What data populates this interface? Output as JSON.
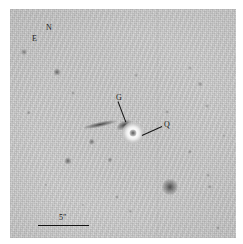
{
  "figure": {
    "type": "astronomical-finding-chart",
    "rendering": "negative-grayscale",
    "background_color": "#ffffff",
    "plate_color": "#d6d6d6",
    "ink_color": "#151515"
  },
  "compass": {
    "north_label": "N",
    "east_label": "E",
    "north_x": 36,
    "north_y": 15,
    "east_x": 22,
    "east_y": 26
  },
  "annotations": [
    {
      "label": "G",
      "meaning": "galaxy",
      "label_x": 106,
      "label_y": 85,
      "leader_from_x": 108,
      "leader_from_y": 92,
      "leader_to_x": 116,
      "leader_to_y": 113
    },
    {
      "label": "Q",
      "meaning": "quasar",
      "label_x": 154,
      "label_y": 112,
      "leader_from_x": 152,
      "leader_from_y": 117,
      "leader_to_x": 132,
      "leader_to_y": 126
    }
  ],
  "scalebar": {
    "label": "5″",
    "value": 5,
    "unit": "arcsec",
    "label_x": 49,
    "label_y": 205,
    "line_x1": 28,
    "line_x2": 79,
    "line_y": 216
  },
  "objects": {
    "quasar": {
      "x": 123,
      "y": 124,
      "size": 22,
      "core_size": 7
    },
    "galaxy_knot": {
      "x": 114,
      "y": 116,
      "w": 16,
      "h": 8,
      "angle": -28
    },
    "galaxy_streak": {
      "x": 90,
      "y": 115,
      "w": 34,
      "h": 5,
      "angle": -12
    },
    "stars": [
      {
        "x": 14,
        "y": 43,
        "r": 3.0,
        "o": 0.55
      },
      {
        "x": 47,
        "y": 63,
        "r": 3.4,
        "o": 0.7
      },
      {
        "x": 19,
        "y": 104,
        "r": 2.2,
        "o": 0.4
      },
      {
        "x": 63,
        "y": 84,
        "r": 2.0,
        "o": 0.32
      },
      {
        "x": 82,
        "y": 133,
        "r": 3.2,
        "o": 0.62
      },
      {
        "x": 58,
        "y": 152,
        "r": 3.6,
        "o": 0.7
      },
      {
        "x": 100,
        "y": 151,
        "r": 2.6,
        "o": 0.48
      },
      {
        "x": 107,
        "y": 188,
        "r": 2.0,
        "o": 0.35
      },
      {
        "x": 180,
        "y": 59,
        "r": 2.0,
        "o": 0.32
      },
      {
        "x": 190,
        "y": 75,
        "r": 2.4,
        "o": 0.42
      },
      {
        "x": 197,
        "y": 97,
        "r": 2.0,
        "o": 0.34
      },
      {
        "x": 157,
        "y": 103,
        "r": 2.1,
        "o": 0.36
      },
      {
        "x": 180,
        "y": 143,
        "r": 2.2,
        "o": 0.38
      },
      {
        "x": 160,
        "y": 178,
        "r": 8.0,
        "o": 0.88
      },
      {
        "x": 200,
        "y": 178,
        "r": 2.2,
        "o": 0.4
      },
      {
        "x": 198,
        "y": 166,
        "r": 1.8,
        "o": 0.3
      },
      {
        "x": 120,
        "y": 202,
        "r": 1.8,
        "o": 0.3
      },
      {
        "x": 208,
        "y": 219,
        "r": 2.0,
        "o": 0.34
      },
      {
        "x": 126,
        "y": 66,
        "r": 1.8,
        "o": 0.28
      },
      {
        "x": 73,
        "y": 196,
        "r": 1.6,
        "o": 0.26
      },
      {
        "x": 36,
        "y": 176,
        "r": 1.7,
        "o": 0.26
      },
      {
        "x": 214,
        "y": 127,
        "r": 1.7,
        "o": 0.26
      }
    ],
    "column_artifact_x": 147
  }
}
